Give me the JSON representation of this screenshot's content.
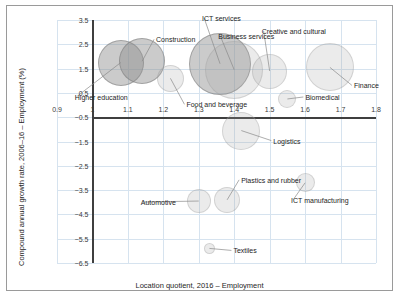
{
  "chart_data": {
    "type": "scatter",
    "title": "",
    "xlabel": "Location quotient, 2016 – Employment",
    "ylabel": "Compound annual growth rate, 2006–16 – Employment (%)",
    "xlim": [
      0.9,
      1.8
    ],
    "ylim": [
      -6.5,
      3.5
    ],
    "xticks": [
      "0.9",
      "1",
      "1.1",
      "1.2",
      "1.3",
      "1.4",
      "1.5",
      "1.6",
      "1.7",
      "1.8"
    ],
    "yticks": [
      "3.5",
      "2.5",
      "1.5",
      "0.5",
      "-0.5",
      "-1.5",
      "-2.5",
      "-3.5",
      "-4.5",
      "-5.5",
      "-6.5"
    ],
    "grid": true,
    "legend": "none",
    "size_encoding": "bubble area ≈ employment size",
    "points": [
      {
        "label": "Higher education",
        "x": 1.08,
        "y": 1.75,
        "size": 46,
        "shade": "dark"
      },
      {
        "label": "Construction",
        "x": 1.14,
        "y": 1.8,
        "size": 46,
        "shade": "dark"
      },
      {
        "label": "Food and beverage",
        "x": 1.22,
        "y": 1.1,
        "size": 27,
        "shade": "light"
      },
      {
        "label": "ICT services",
        "x": 1.36,
        "y": 1.7,
        "size": 62,
        "shade": "dark"
      },
      {
        "label": "Business services",
        "x": 1.4,
        "y": 1.45,
        "size": 58,
        "shade": "light"
      },
      {
        "label": "Creative and cultural",
        "x": 1.5,
        "y": 1.4,
        "size": 35,
        "shade": "light"
      },
      {
        "label": "Biomedical",
        "x": 1.55,
        "y": 0.25,
        "size": 18,
        "shade": "light"
      },
      {
        "label": "Finance",
        "x": 1.67,
        "y": 1.55,
        "size": 48,
        "shade": "light"
      },
      {
        "label": "Logistics",
        "x": 1.42,
        "y": -1.05,
        "size": 38,
        "shade": "light"
      },
      {
        "label": "Automotive",
        "x": 1.3,
        "y": -3.95,
        "size": 24,
        "shade": "light"
      },
      {
        "label": "Plastics and rubber",
        "x": 1.38,
        "y": -3.9,
        "size": 26,
        "shade": "light"
      },
      {
        "label": "ICT manufacturing",
        "x": 1.6,
        "y": -3.2,
        "size": 19,
        "shade": "light"
      },
      {
        "label": "Textiles",
        "x": 1.33,
        "y": -5.9,
        "size": 11,
        "shade": "light"
      }
    ]
  },
  "colors": {
    "grid": "#d6e3ef",
    "axis": "#3f3f3f",
    "bubble": "#969696",
    "text": "#1d1d1d",
    "frame": "#9a9a9a"
  }
}
